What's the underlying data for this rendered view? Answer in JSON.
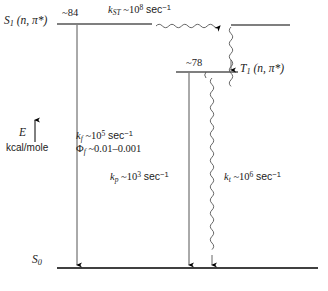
{
  "figure": {
    "type": "energy-level-diagram",
    "axis": {
      "symbol": "E",
      "arrow": "up-arrow-icon",
      "units": "kcal/mole"
    },
    "levels": [
      {
        "id": "s1",
        "label_state": "S",
        "label_sub": "1",
        "label_config": "(n, π*)",
        "energy": "~84",
        "y": 24
      },
      {
        "id": "t1",
        "label_state": "T",
        "label_sub": "1",
        "label_config": "(n, π*)",
        "energy": "~78",
        "y": 72
      },
      {
        "id": "s0",
        "label_state": "S",
        "label_sub": "0",
        "label_config": "",
        "energy": "",
        "y": 268
      }
    ],
    "processes": [
      {
        "id": "intersystem-crossing",
        "style": "wavy-horizontal-arrow",
        "rate_symbol": "k",
        "rate_sub": "ST",
        "rate_value": "~10",
        "rate_exp": "8",
        "rate_units": "sec",
        "rate_units_exp": "−1"
      },
      {
        "id": "fluorescence",
        "style": "straight-down-arrow",
        "rate_symbol": "k",
        "rate_sub": "f",
        "rate_value": "~10",
        "rate_exp": "5",
        "rate_units": "sec",
        "rate_units_exp": "−1",
        "yield_symbol": "Φ",
        "yield_sub": "f",
        "yield_value": "~0.01–0.001"
      },
      {
        "id": "phosphorescence",
        "style": "straight-down-arrow",
        "rate_symbol": "k",
        "rate_sub": "p",
        "rate_value": "~10",
        "rate_exp": "3",
        "rate_units": "sec",
        "rate_units_exp": "−1"
      },
      {
        "id": "triplet-radiationless-decay",
        "style": "wavy-down-arrow",
        "rate_symbol": "k",
        "rate_sub": "t",
        "rate_value": "~10",
        "rate_exp": "6",
        "rate_units": "sec",
        "rate_units_exp": "−1"
      }
    ]
  },
  "colors": {
    "line": "#000000",
    "background": "#ffffff",
    "text": "#111111"
  }
}
